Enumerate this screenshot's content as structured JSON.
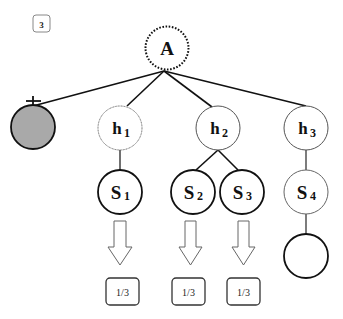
{
  "figure": {
    "corner_badge": "3",
    "colors": {
      "stroke_dark": "#111111",
      "stroke_light": "#555555",
      "filled_node": "#a9a9a9",
      "background": "#ffffff"
    },
    "root": {
      "label": "A",
      "style": "dotted"
    },
    "pruned_node": {
      "label": "",
      "fill": "gray",
      "marker": "cross"
    },
    "hypotheses": [
      {
        "label": "h",
        "sub": "1"
      },
      {
        "label": "h",
        "sub": "2"
      },
      {
        "label": "h",
        "sub": "3"
      }
    ],
    "states": [
      {
        "label": "S",
        "sub": "1",
        "parent": "h1"
      },
      {
        "label": "S",
        "sub": "2",
        "parent": "h2"
      },
      {
        "label": "S",
        "sub": "3",
        "parent": "h2"
      },
      {
        "label": "S",
        "sub": "4",
        "parent": "h3"
      }
    ],
    "leaf_node": {
      "label": "",
      "parent": "S4"
    },
    "outputs": [
      {
        "value": "1/3",
        "from": "S1"
      },
      {
        "value": "1/3",
        "from": "S2"
      },
      {
        "value": "1/3",
        "from": "S3"
      }
    ]
  }
}
